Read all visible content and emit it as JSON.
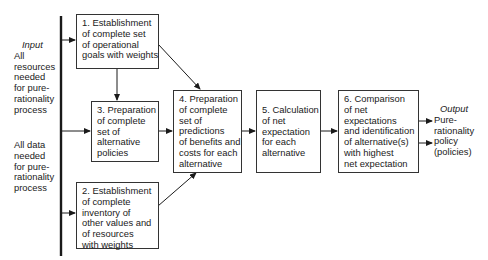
{
  "input": {
    "title": "Input",
    "resources": [
      "All",
      "resources",
      "needed",
      "for pure-",
      "rationality",
      "process"
    ],
    "data": [
      "All data",
      "needed",
      "for pure-",
      "rationality",
      "process"
    ]
  },
  "boxes": {
    "b1": [
      "1. Establishment",
      "of complete set",
      "of operational",
      "goals with weights"
    ],
    "b2": [
      "2. Establishment",
      "of complete",
      "inventory of",
      "other values and",
      "of resources",
      "with weights"
    ],
    "b3": [
      "3. Preparation",
      "of complete",
      "set of",
      "alternative",
      "policies"
    ],
    "b4": [
      "4. Preparation",
      "of complete",
      "set of",
      "predictions",
      "of benefits and",
      "costs for each",
      "alternative"
    ],
    "b5": [
      "5. Calculation",
      "of net",
      "expectation",
      "for each",
      "alternative"
    ],
    "b6": [
      "6. Comparison",
      "of net",
      "expectations",
      "and identification",
      "of alternative(s)",
      "with highest",
      "net expectation"
    ]
  },
  "output": {
    "title": "Output",
    "lines": [
      "Pure-",
      "rationality",
      "policy",
      "(policies)"
    ]
  },
  "colors": {
    "line": "#1a1a1a",
    "background": "#ffffff"
  }
}
